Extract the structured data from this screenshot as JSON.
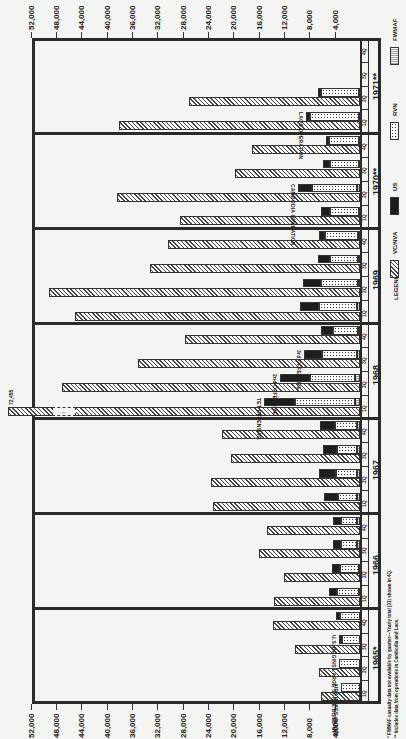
{
  "chart_data": {
    "type": "bar",
    "orientation": "horizontal stacked, image rotated 90 degrees",
    "title": "",
    "xlabel": "",
    "ylabel": "",
    "value_axis": {
      "ticks": [
        "4,000",
        "8,000",
        "12,000",
        "16,000",
        "20,000",
        "24,000",
        "28,000",
        "32,000",
        "36,000",
        "40,000",
        "44,000",
        "48,000",
        "52,000"
      ],
      "range": [
        0,
        52000
      ]
    },
    "legend": {
      "title": "LEGEND",
      "entries": [
        {
          "key": "vc",
          "label": "VC/NVA"
        },
        {
          "key": "us",
          "label": "US"
        },
        {
          "key": "rvn",
          "label": "RVN"
        },
        {
          "key": "fw",
          "label": "FWMAF"
        }
      ]
    },
    "years": [
      {
        "label": "1965*",
        "quarters": [
          {
            "q": "1Q",
            "vc": 6200,
            "us": 0,
            "rvn": 3000,
            "fw": 0,
            "annotation": "AIRSTRIKES on NVN"
          },
          {
            "q": "2Q",
            "vc": 6500,
            "us": 0,
            "rvn": 3300,
            "fw": 0
          },
          {
            "q": "3Q",
            "vc": 10300,
            "us": 400,
            "rvn": 2900,
            "fw": 0,
            "annotation": "U.S. BEGINS LARGE SCALE BUILD-UP"
          },
          {
            "q": "4Q",
            "vc": 13700,
            "us": 600,
            "rvn": 3200,
            "fw": 0
          }
        ]
      },
      {
        "label": "1966",
        "quarters": [
          {
            "q": "1Q",
            "vc": 13600,
            "us": 1200,
            "rvn": 3500,
            "fw": 200
          },
          {
            "q": "2Q",
            "vc": 12000,
            "us": 1300,
            "rvn": 3000,
            "fw": 200
          },
          {
            "q": "3Q",
            "vc": 15900,
            "us": 1200,
            "rvn": 2500,
            "fw": 500
          },
          {
            "q": "4Q",
            "vc": 14700,
            "us": 1200,
            "rvn": 2600,
            "fw": 400
          }
        ]
      },
      {
        "label": "1967",
        "quarters": [
          {
            "q": "1Q",
            "vc": 23200,
            "us": 2200,
            "rvn": 3000,
            "fw": 500
          },
          {
            "q": "2Q",
            "vc": 23500,
            "us": 2700,
            "rvn": 3300,
            "fw": 500
          },
          {
            "q": "3Q",
            "vc": 20400,
            "us": 2100,
            "rvn": 3200,
            "fw": 500
          },
          {
            "q": "4Q",
            "vc": 21800,
            "us": 2300,
            "rvn": 3500,
            "fw": 500
          }
        ]
      },
      {
        "label": "1968",
        "quarters": [
          {
            "q": "1Q",
            "vc": 72455,
            "us": 4900,
            "rvn": 9500,
            "fw": 800,
            "annotation": "TET OFFENSIVE",
            "broken_label": "72,455"
          },
          {
            "q": "2Q",
            "vc": 47000,
            "us": 4700,
            "rvn": 7100,
            "fw": 800,
            "annotation": "2nd OFFENSIVE"
          },
          {
            "q": "3Q",
            "vc": 35000,
            "us": 2800,
            "rvn": 5500,
            "fw": 500,
            "annotation": "3rd OFFENSIVE"
          },
          {
            "q": "4Q",
            "vc": 27600,
            "us": 1800,
            "rvn": 4000,
            "fw": 300
          }
        ]
      },
      {
        "label": "1969",
        "quarters": [
          {
            "q": "1Q",
            "vc": 45000,
            "us": 3000,
            "rvn": 6000,
            "fw": 500
          },
          {
            "q": "2Q",
            "vc": 49100,
            "us": 2900,
            "rvn": 5800,
            "fw": 300
          },
          {
            "q": "3Q",
            "vc": 33200,
            "us": 1800,
            "rvn": 4500,
            "fw": 300
          },
          {
            "q": "4Q",
            "vc": 30300,
            "us": 1000,
            "rvn": 5200,
            "fw": 300
          }
        ]
      },
      {
        "label": "1970**",
        "quarters": [
          {
            "q": "1Q",
            "vc": 28400,
            "us": 1500,
            "rvn": 4500,
            "fw": 200
          },
          {
            "q": "2Q",
            "vc": 38400,
            "us": 2200,
            "rvn": 7100,
            "fw": 500,
            "annotation": "CAMBODIA OPERATION"
          },
          {
            "q": "3Q",
            "vc": 19700,
            "us": 1000,
            "rvn": 4600,
            "fw": 200
          },
          {
            "q": "4Q",
            "vc": 17000,
            "us": 500,
            "rvn": 4700,
            "fw": 200
          }
        ]
      },
      {
        "label": "1971**",
        "quarters": [
          {
            "q": "1Q",
            "vc": 38100,
            "us": 600,
            "rvn": 7700,
            "fw": 200,
            "annotation": "LAOS OPERATION"
          },
          {
            "q": "2Q",
            "vc": 27000,
            "us": 500,
            "rvn": 5900,
            "fw": 200
          },
          {
            "q": "3Q",
            "vc": null,
            "us": null,
            "rvn": null,
            "fw": null
          },
          {
            "q": "4Q",
            "vc": null,
            "us": null,
            "rvn": null,
            "fw": null
          }
        ]
      }
    ],
    "footnotes": [
      "* FWMAF casualty data not available by quarter—Yearly total (31) shown in 4Q.",
      "** Includes data from operations in Cambodia and Laos."
    ]
  }
}
